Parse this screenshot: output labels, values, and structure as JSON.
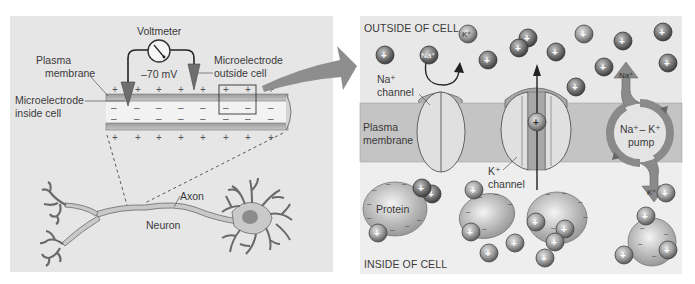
{
  "left_panel": {
    "voltmeter_label": "Voltmeter",
    "voltage_reading": "–70 mV",
    "plasma_membrane_label_line1": "Plasma",
    "plasma_membrane_label_line2": "membrane",
    "microelectrode_outside_line1": "Microelectrode",
    "microelectrode_outside_line2": "outside cell",
    "microelectrode_inside_line1": "Microelectrode",
    "microelectrode_inside_line2": "inside cell",
    "axon_label": "Axon",
    "neuron_label": "Neuron",
    "outer_charge": "+",
    "inner_charge": "–"
  },
  "right_panel": {
    "outside_label": "OUTSIDE OF CELL",
    "inside_label": "INSIDE OF CELL",
    "plasma_membrane_label_line1": "Plasma",
    "plasma_membrane_label_line2": "membrane",
    "na_channel_label_line1": "Na⁺",
    "na_channel_label_line2": "channel",
    "k_channel_label_line1": "K⁺",
    "k_channel_label_line2": "channel",
    "pump_label_line1": "Na⁺– K⁺",
    "pump_label_line2": "pump",
    "protein_label": "Protein",
    "na_ion_label": "Na⁺",
    "k_ion_label": "K⁺",
    "cation_symbol": "+",
    "anion_symbol": "–"
  },
  "colors": {
    "panel_bg": "#e6e6e6",
    "membrane_band": "#c4c4c4",
    "ion_dark": "#5a5a5a",
    "pump_arrow": "#8a8a8a",
    "arrow_big": "#8e8e8e",
    "channel_fill": "#dcdcdc"
  }
}
